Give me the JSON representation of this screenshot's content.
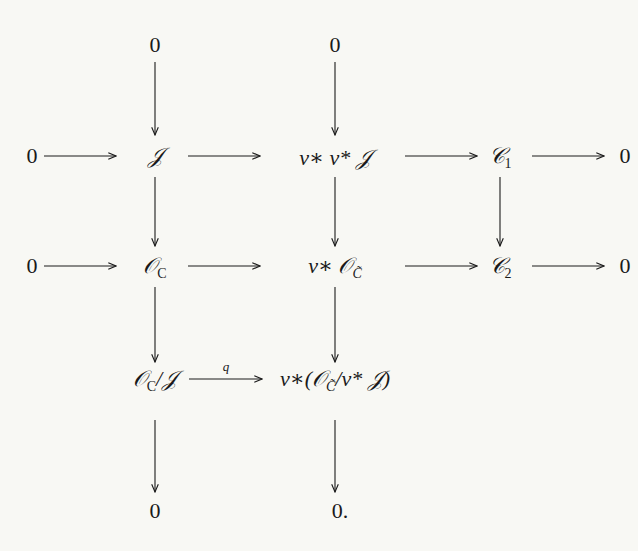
{
  "diagram": {
    "type": "commutative-diagram",
    "nodes": {
      "top_zero_1": "0",
      "top_zero_2": "0",
      "left_zero_1": "0",
      "left_zero_2": "0",
      "I": "𝒥",
      "v_star_v_star_I": "v∗ v* 𝒥",
      "C1": "𝒞",
      "C1_sub": "1",
      "right_zero_1": "0",
      "O_C": "𝒪",
      "O_C_sub": "C",
      "v_star_O_Ctilde": "v∗ 𝒪",
      "Ctilde_sub": "C̃",
      "C2": "𝒞",
      "C2_sub": "2",
      "right_zero_2": "0",
      "O_C_mod_I": "𝒪",
      "O_C_mod_I_rest": "/𝒥",
      "v_star_quot": "v∗(𝒪",
      "v_star_quot_rest": "/v* 𝒥)",
      "bottom_zero_1": "0",
      "bottom_zero_2": "0."
    },
    "arrow_labels": {
      "q": "q"
    }
  }
}
